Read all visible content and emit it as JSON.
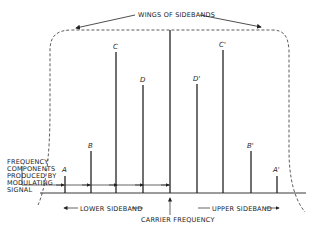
{
  "title": "WINGS OF SIDEBANDS",
  "left_note": [
    "FREQUENCY",
    "COMPONENTS",
    "PRODUCED BY",
    "MODULATING",
    "SIGNAL"
  ],
  "lower_sideband_label": "LOWER SIDEBAND",
  "upper_sideband_label": "UPPER SIDEBAND",
  "carrier_label": "CARRIER FREQUENCY",
  "components": {
    "A": "A",
    "B": "B",
    "C": "C",
    "D": "D",
    "D_prime": "D'",
    "C_prime": "C'",
    "B_prime": "B'",
    "A_prime": "A'"
  },
  "colors": {
    "ink": "#222222",
    "background": "#ffffff"
  }
}
